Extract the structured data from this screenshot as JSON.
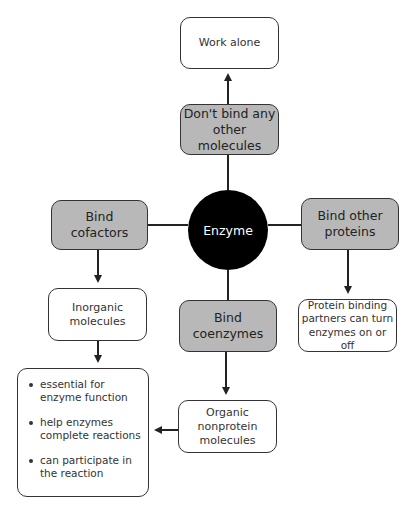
{
  "center": {
    "label": "Enzyme"
  },
  "nodes": {
    "work_alone": "Work alone",
    "dont_bind": "Don't bind any other molecules",
    "bind_cofactors": "Bind cofactors",
    "bind_other_proteins": "Bind other proteins",
    "inorganic": "Inorganic molecules",
    "bind_coenzymes": "Bind coenzymes",
    "protein_binding": "Protein binding partners can turn enzymes on or off",
    "organic": "Organic nonprotein molecules"
  },
  "bullets": [
    "essential for enzyme function",
    "help enzymes complete reactions",
    "can participate in the reaction"
  ],
  "colors": {
    "gray_box": "#b8b8b8",
    "circle": "#000000",
    "line": "#222222"
  }
}
